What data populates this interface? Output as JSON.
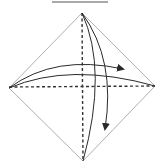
{
  "diagram": {
    "type": "origami-fold-step",
    "description": "Square paper rotated as a diamond with valley-fold crease lines and fold arrows",
    "colors": {
      "background": "#ffffff",
      "paper_edge": "#b0b0b0",
      "crease": "#333333",
      "arrow": "#2a2a2a",
      "top_rule": "#555555"
    },
    "top_rule": {
      "x1": 52,
      "x2": 108,
      "y": 2
    },
    "diamond": {
      "top": [
        82,
        13
      ],
      "right": [
        155,
        86
      ],
      "bottom": [
        83,
        161
      ],
      "left": [
        9,
        88
      ]
    },
    "creases": [
      {
        "name": "horizontal-valley-fold",
        "style": "dashed"
      },
      {
        "name": "vertical-valley-fold",
        "style": "dashed"
      }
    ],
    "arrows": [
      {
        "name": "fold-left-to-right-arrow",
        "direction": "right",
        "head": [
          124,
          68
        ]
      },
      {
        "name": "fold-top-to-bottom-arrow",
        "direction": "down",
        "head": [
          105,
          130
        ]
      }
    ]
  }
}
